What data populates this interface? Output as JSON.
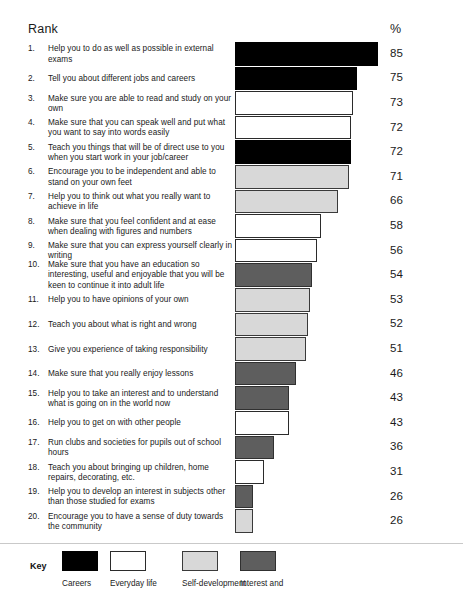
{
  "header": {
    "rank_label": "Rank",
    "pct_label": "%"
  },
  "chart_data": {
    "type": "bar",
    "title": "Rank",
    "xlabel": "",
    "ylabel": "%",
    "orientation": "horizontal",
    "grid": false,
    "legend_position": "bottom",
    "xlim": [
      0,
      100
    ],
    "categories": [
      "Help you to do as well as possible in external exams",
      "Tell you about different jobs and careers",
      "Make sure you are able to read and study on your own",
      "Make sure that you can speak well and put what you want to say into words easily",
      "Teach you things that will be of direct use to you when you start work in your job/career",
      "Encourage you to be independent and able to stand on your own feet",
      "Help you to think out what you really want to achieve in life",
      "Make sure that you feel confident and at ease when dealing with figures and numbers",
      "Make sure that you can express yourself clearly in writing",
      "Make sure that you have an education so interesting, useful and enjoyable that you will be keen to continue it into adult life",
      "Help you to have opinions of your own",
      "Teach you about what is right and wrong",
      "Give you experience of taking responsibility",
      "Make sure that you really enjoy lessons",
      "Help you to take an interest and to understand what is going on in the world now",
      "Help you to get on with other people",
      "Run clubs and societies for pupils out of school hours",
      "Teach you about bringing up children, home repairs, decorating, etc.",
      "Help you to develop an interest in subjects other than those studied for exams",
      "Encourage you to have a sense of duty towards the community"
    ],
    "values": [
      85,
      75,
      73,
      72,
      72,
      71,
      66,
      58,
      56,
      54,
      53,
      52,
      51,
      46,
      43,
      43,
      36,
      31,
      26,
      26
    ],
    "series": [
      {
        "name": "Percentage",
        "values": [
          85,
          75,
          73,
          72,
          72,
          71,
          66,
          58,
          56,
          54,
          53,
          52,
          51,
          46,
          43,
          43,
          36,
          31,
          26,
          26
        ]
      }
    ]
  },
  "rows": [
    {
      "rank": "1.",
      "label": "Help you to do as well as possible in external exams",
      "value": 85,
      "pct": "85",
      "category": "careers"
    },
    {
      "rank": "2.",
      "label": "Tell you about different jobs and careers",
      "value": 75,
      "pct": "75",
      "category": "careers"
    },
    {
      "rank": "3.",
      "label": "Make sure you are able to read and study on your own",
      "value": 73,
      "pct": "73",
      "category": "everyday"
    },
    {
      "rank": "4.",
      "label": "Make sure that you can speak well and put what you want to say into words easily",
      "value": 72,
      "pct": "72",
      "category": "everyday"
    },
    {
      "rank": "5.",
      "label": "Teach you things that will be of direct use to you when you start work in your job/career",
      "value": 72,
      "pct": "72",
      "category": "careers"
    },
    {
      "rank": "6.",
      "label": "Encourage you to be independent and able to stand on your own feet",
      "value": 71,
      "pct": "71",
      "category": "selfdev"
    },
    {
      "rank": "7.",
      "label": "Help you to think out what you really want to achieve in life",
      "value": 66,
      "pct": "66",
      "category": "selfdev"
    },
    {
      "rank": "8.",
      "label": "Make sure that you feel confident and at ease when dealing with figures and numbers",
      "value": 58,
      "pct": "58",
      "category": "everyday"
    },
    {
      "rank": "9.",
      "label": "Make sure that you can express yourself clearly in writing",
      "value": 56,
      "pct": "56",
      "category": "everyday"
    },
    {
      "rank": "10.",
      "label": "Make sure that you have an education so interesting, useful and enjoyable that you will be keen to continue it into adult life",
      "value": 54,
      "pct": "54",
      "category": "interest"
    },
    {
      "rank": "11.",
      "label": "Help you to have opinions of your own",
      "value": 53,
      "pct": "53",
      "category": "selfdev"
    },
    {
      "rank": "12.",
      "label": "Teach you about what is right and wrong",
      "value": 52,
      "pct": "52",
      "category": "selfdev"
    },
    {
      "rank": "13.",
      "label": "Give you experience of taking responsibility",
      "value": 51,
      "pct": "51",
      "category": "selfdev"
    },
    {
      "rank": "14.",
      "label": "Make sure that you really enjoy lessons",
      "value": 46,
      "pct": "46",
      "category": "interest"
    },
    {
      "rank": "15.",
      "label": "Help you to take an interest and to understand what is going on in the world now",
      "value": 43,
      "pct": "43",
      "category": "interest"
    },
    {
      "rank": "16.",
      "label": "Help you to get on with other people",
      "value": 43,
      "pct": "43",
      "category": "everyday"
    },
    {
      "rank": "17.",
      "label": "Run clubs and societies for pupils out of school hours",
      "value": 36,
      "pct": "36",
      "category": "interest"
    },
    {
      "rank": "18.",
      "label": "Teach you about bringing up children, home repairs, decorating, etc.",
      "value": 31,
      "pct": "31",
      "category": "everyday"
    },
    {
      "rank": "19.",
      "label": "Help you to develop an interest in subjects other than those studied for exams",
      "value": 26,
      "pct": "26",
      "category": "interest"
    },
    {
      "rank": "20.",
      "label": "Encourage you to have a sense of duty towards the community",
      "value": 26,
      "pct": "26",
      "category": "selfdev"
    }
  ],
  "legend": {
    "title": "Key",
    "items": [
      {
        "label": "Careers",
        "category": "careers",
        "color": "#000000"
      },
      {
        "label": "Everyday life",
        "category": "everyday",
        "color": "#ffffff"
      },
      {
        "label": "Self-development",
        "category": "selfdev",
        "color": "#d8d8d8"
      },
      {
        "label": "Interest and",
        "category": "interest",
        "color": "#5e5e5e"
      }
    ]
  },
  "layout": {
    "bar_origin_x": 198,
    "bar_scale_px_per_unit": 2.12,
    "first_row_top": 42,
    "row_height": 24.6,
    "bar_height": 23.6
  }
}
